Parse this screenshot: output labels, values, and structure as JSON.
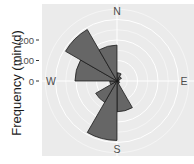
{
  "chart_data": {
    "type": "rose",
    "title": "",
    "xlabel": "",
    "ylabel": "Frequency (min/d)",
    "radial_ticks": [
      0,
      100,
      200
    ],
    "radial_max": 290,
    "grid": true,
    "direction_labels": [
      "N",
      "E",
      "S",
      "W"
    ],
    "bin_width_deg": 30,
    "categories": [
      "0-30",
      "30-60",
      "60-90",
      "90-120",
      "120-150",
      "150-180",
      "180-210",
      "210-240",
      "240-270",
      "270-300",
      "300-330",
      "330-360"
    ],
    "values": [
      40,
      25,
      10,
      10,
      15,
      150,
      290,
      120,
      35,
      205,
      290,
      175
    ],
    "colors": {
      "panel": "#ebebeb",
      "grid": "#ffffff",
      "bar_fill": "#666666",
      "bar_edge": "#1a1a1a"
    }
  }
}
